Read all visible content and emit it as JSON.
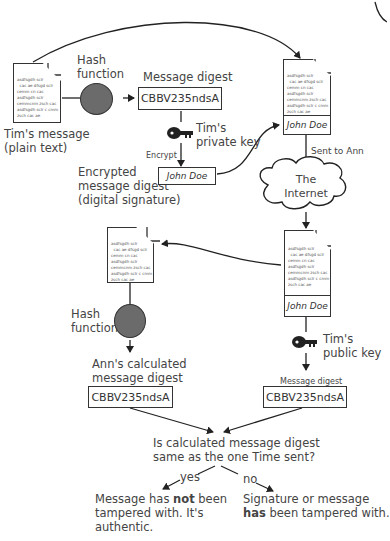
{
  "diagram": {
    "document_text_lines": [
      "asdfsgdh sclr",
      "  cac ae dfsgd sclr",
      "cemm cn cac",
      "asdfsgdh sclr",
      "cemmcnm zsch cac",
      "asdfsgdh sclr c cmm",
      "zsch cac ae"
    ],
    "signature_name": "John Doe",
    "sender": {
      "message_label_line1": "Tim's message",
      "message_label_line2": "(plain text)",
      "hash_label_line1": "Hash",
      "hash_label_line2": "function",
      "digest_label": "Message digest",
      "digest_value": "CBBV235ndsA",
      "private_key_line1": "Tim's",
      "private_key_line2": "private key",
      "encrypt_label": "Encrypt",
      "encrypted_line1": "Encrypted",
      "encrypted_line2": "message digest",
      "encrypted_line3": "(digital signature)"
    },
    "transport": {
      "sent_label": "Sent to Ann",
      "cloud_line1": "The",
      "cloud_line2": "Internet"
    },
    "receiver": {
      "hash_label_line1": "Hash",
      "hash_label_line2": "function",
      "calc_label_line1": "Ann's calculated",
      "calc_label_line2": "message digest",
      "calc_value": "CBBV235ndsA",
      "public_key_line1": "Tim's",
      "public_key_line2": "public key",
      "decrypted_label": "Message digest",
      "decrypted_value": "CBBV235ndsA"
    },
    "decision": {
      "question_line1": "Is calculated message digest",
      "question_line2": "same as the one Time sent?",
      "yes_label": "yes",
      "no_label": "no",
      "yes_result_pre": "Message has ",
      "yes_result_bold": "not",
      "yes_result_post": " been",
      "yes_result_line2": "tampered with. It's",
      "yes_result_line3": "authentic.",
      "no_result_line1": "Signature or message",
      "no_result_bold": "has",
      "no_result_post": " been tampered with."
    }
  }
}
